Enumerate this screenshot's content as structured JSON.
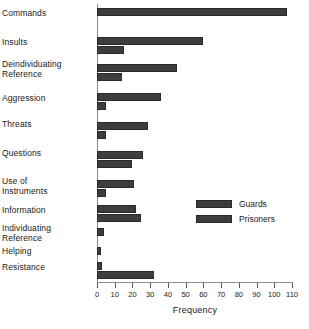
{
  "chart_data": {
    "type": "bar",
    "orientation": "horizontal",
    "title": "",
    "xlabel": "Frequency",
    "ylabel": "",
    "xlim": [
      0,
      110
    ],
    "xticks": [
      0,
      10,
      20,
      30,
      40,
      50,
      60,
      70,
      80,
      90,
      100,
      110
    ],
    "grid": false,
    "legend_position": "middle-right",
    "categories": [
      "Commands",
      "Insults",
      "Deindividuating Reference",
      "Aggression",
      "Threats",
      "Questions",
      "Use of Instruments",
      "Information",
      "Individuating Reference",
      "Helping",
      "Resistance"
    ],
    "category_label_lines": [
      [
        "Commands"
      ],
      [
        "Insults"
      ],
      [
        "Deindividuating",
        "Reference"
      ],
      [
        "Aggression"
      ],
      [
        "Threats"
      ],
      [
        "Questions"
      ],
      [
        "Use of",
        "Instruments"
      ],
      [
        "Information"
      ],
      [
        "Individuating",
        "Reference"
      ],
      [
        "Helping"
      ],
      [
        "Resistance"
      ]
    ],
    "series": [
      {
        "name": "Guards",
        "color": "#3d3d3d",
        "values": [
          107,
          60,
          45,
          36,
          29,
          26,
          21,
          22,
          4,
          2,
          3
        ]
      },
      {
        "name": "Prisoners",
        "color": "#3d3d3d",
        "values": [
          0,
          15,
          14,
          5,
          5,
          20,
          5,
          25,
          0,
          0,
          32
        ]
      }
    ]
  },
  "legend": {
    "items": [
      {
        "label": "Guards"
      },
      {
        "label": "Prisoners"
      }
    ]
  },
  "axis": {
    "x_title": "Frequency"
  },
  "colors": {
    "bar_fill": "#3d3d3d",
    "bar_stroke": "#2a2a2a",
    "axis": "#8c8c8c",
    "text": "#1a1a1a",
    "background": "#ffffff"
  }
}
